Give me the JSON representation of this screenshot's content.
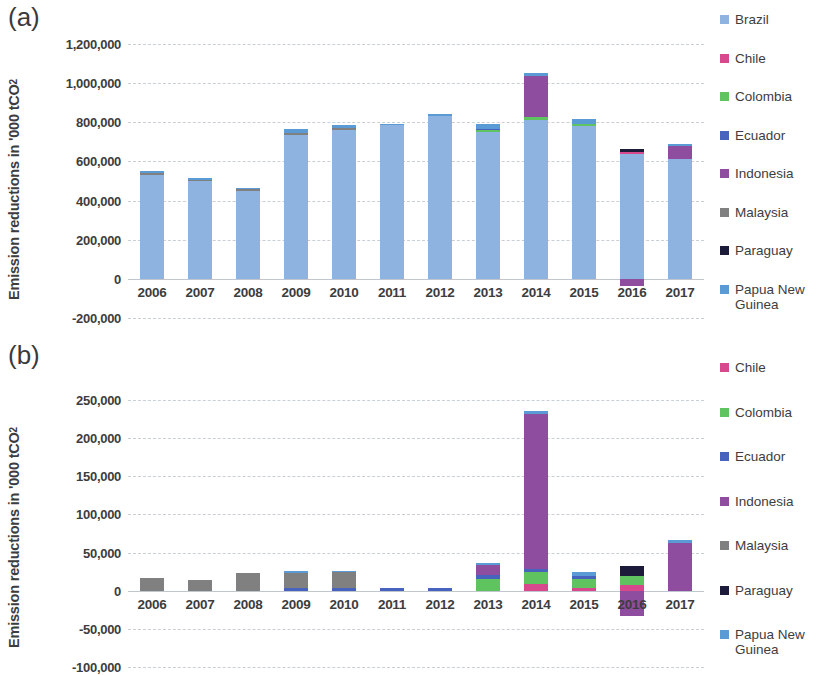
{
  "figure": {
    "panel_a_label": "(a)",
    "panel_b_label": "(b)"
  },
  "colors": {
    "Brazil": "#8FB3E0",
    "Chile": "#D8488C",
    "Colombia": "#5FC45F",
    "Ecuador": "#4763BE",
    "Indonesia": "#8E4D9E",
    "Malaysia": "#808080",
    "Paraguay": "#1C1C3A",
    "Papua New Guinea": "#5B9BD5"
  },
  "chart_data": [
    {
      "type": "bar",
      "id": "panel-a",
      "stacked": true,
      "title": "(a)",
      "xlabel": "",
      "ylabel": "Emission reductions in '000 tCO2",
      "ylabel_display": "Emission reductions in '000 tCO",
      "ylabel_sub": "2",
      "categories": [
        "2006",
        "2007",
        "2008",
        "2009",
        "2010",
        "2011",
        "2012",
        "2013",
        "2014",
        "2015",
        "2016",
        "2017"
      ],
      "ylim": [
        -200000,
        1200000
      ],
      "yticks": [
        1200000,
        1000000,
        800000,
        600000,
        400000,
        200000,
        0,
        -200000
      ],
      "ytick_labels": [
        "1,200,000",
        "1,000,000",
        "800,000",
        "600,000",
        "400,000",
        "200,000",
        "0",
        "-200,000"
      ],
      "grid": true,
      "legend_position": "right",
      "series": [
        {
          "name": "Brazil",
          "values": [
            532000,
            499000,
            450000,
            735000,
            760000,
            790000,
            840000,
            750000,
            810000,
            780000,
            640000,
            610000
          ]
        },
        {
          "name": "Chile",
          "values": [
            0,
            0,
            0,
            0,
            0,
            0,
            0,
            0,
            0,
            0,
            9000,
            0
          ]
        },
        {
          "name": "Colombia",
          "values": [
            0,
            0,
            0,
            0,
            0,
            0,
            0,
            13000,
            18000,
            11000,
            0,
            0
          ]
        },
        {
          "name": "Ecuador",
          "values": [
            0,
            0,
            0,
            0,
            0,
            0,
            0,
            4000,
            0,
            0,
            0,
            0
          ]
        },
        {
          "name": "Indonesia",
          "values": [
            0,
            0,
            0,
            0,
            0,
            0,
            0,
            0,
            208000,
            0,
            -38000,
            72000
          ]
        },
        {
          "name": "Malaysia",
          "values": [
            9000,
            8000,
            10000,
            12000,
            12000,
            0,
            0,
            0,
            0,
            0,
            0,
            0
          ]
        },
        {
          "name": "Paraguay",
          "values": [
            0,
            0,
            0,
            0,
            0,
            0,
            0,
            0,
            0,
            0,
            12000,
            0
          ]
        },
        {
          "name": "Papua New Guinea",
          "values": [
            8000,
            7000,
            5000,
            17000,
            14000,
            3000,
            2000,
            22000,
            18000,
            25000,
            0,
            5000
          ]
        }
      ],
      "totals": [
        "549,000",
        "514,000",
        "465,000",
        "764,000",
        "786,000",
        "793,000",
        "842,000",
        "789,000",
        "1,054,000",
        "816,000",
        "661,000",
        "687,000"
      ]
    },
    {
      "type": "bar",
      "id": "panel-b",
      "stacked": true,
      "title": "(b)",
      "xlabel": "",
      "ylabel": "Emission reductions in '000 tCO2",
      "ylabel_display": "Emission reductions in '000 tCO",
      "ylabel_sub": "2",
      "categories": [
        "2006",
        "2007",
        "2008",
        "2009",
        "2010",
        "2011",
        "2012",
        "2013",
        "2014",
        "2015",
        "2016",
        "2017"
      ],
      "ylim": [
        -100000,
        250000
      ],
      "yticks": [
        250000,
        200000,
        150000,
        100000,
        50000,
        0,
        -50000,
        -100000
      ],
      "ytick_labels": [
        "250,000",
        "200,000",
        "150,000",
        "100,000",
        "50,000",
        "0",
        "-50,000",
        "-100,000"
      ],
      "grid": true,
      "legend_position": "right",
      "series": [
        {
          "name": "Chile",
          "values": [
            0,
            0,
            0,
            0,
            0,
            0,
            0,
            0,
            9000,
            4000,
            8000,
            0
          ]
        },
        {
          "name": "Colombia",
          "values": [
            0,
            0,
            0,
            0,
            0,
            0,
            0,
            16000,
            16000,
            12000,
            11000,
            0
          ]
        },
        {
          "name": "Ecuador",
          "values": [
            0,
            0,
            0,
            4000,
            4000,
            4000,
            4000,
            4000,
            4000,
            3000,
            0,
            0
          ]
        },
        {
          "name": "Indonesia",
          "values": [
            0,
            0,
            0,
            0,
            0,
            0,
            0,
            14000,
            203000,
            0,
            -33000,
            63000
          ]
        },
        {
          "name": "Malaysia",
          "values": [
            17000,
            14000,
            23000,
            19000,
            20000,
            0,
            0,
            0,
            0,
            0,
            0,
            0
          ]
        },
        {
          "name": "Paraguay",
          "values": [
            0,
            0,
            0,
            0,
            0,
            0,
            0,
            0,
            0,
            0,
            13000,
            0
          ]
        },
        {
          "name": "Papua New Guinea",
          "values": [
            0,
            0,
            0,
            3000,
            2000,
            0,
            0,
            2000,
            4000,
            5000,
            0,
            3000
          ]
        }
      ],
      "totals": [
        "17,000",
        "14,000",
        "23,000",
        "26,000",
        "26,000",
        "4,000",
        "4,000",
        "36,000",
        "236,000",
        "24,000",
        "32,000",
        "66,000"
      ]
    }
  ],
  "legend_a": {
    "items": [
      {
        "label": "Brazil",
        "color_key": "Brazil"
      },
      {
        "label": "Chile",
        "color_key": "Chile"
      },
      {
        "label": "Colombia",
        "color_key": "Colombia"
      },
      {
        "label": "Ecuador",
        "color_key": "Ecuador"
      },
      {
        "label": "Indonesia",
        "color_key": "Indonesia"
      },
      {
        "label": "Malaysia",
        "color_key": "Malaysia"
      },
      {
        "label": "Paraguay",
        "color_key": "Paraguay"
      },
      {
        "label": "Papua New Guinea",
        "color_key": "Papua New Guinea"
      }
    ]
  },
  "legend_b": {
    "items": [
      {
        "label": "Chile",
        "color_key": "Chile"
      },
      {
        "label": "Colombia",
        "color_key": "Colombia"
      },
      {
        "label": "Ecuador",
        "color_key": "Ecuador"
      },
      {
        "label": "Indonesia",
        "color_key": "Indonesia"
      },
      {
        "label": "Malaysia",
        "color_key": "Malaysia"
      },
      {
        "label": "Paraguay",
        "color_key": "Paraguay"
      },
      {
        "label": "Papua New Guinea",
        "color_key": "Papua New Guinea"
      }
    ]
  }
}
